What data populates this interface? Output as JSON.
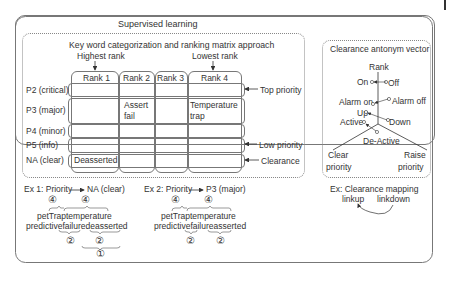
{
  "supervised_learning": {
    "title": "Supervised learning",
    "matrix": {
      "title": "Key word categorization and ranking matrix approach",
      "highest_rank_label": "Highest rank",
      "lowest_rank_label": "Lowest rank",
      "columns": [
        "Rank 1",
        "Rank 2",
        "Rank 3",
        "Rank 4"
      ],
      "rows": [
        {
          "label": "P2 (critical)",
          "cells": [
            "",
            "",
            "",
            ""
          ],
          "side_label": "Top priority"
        },
        {
          "label": "P3 (major)",
          "cells": [
            "",
            "Assert fail",
            "",
            "Temperature trap"
          ],
          "side_label": ""
        },
        {
          "label": "P4 (minor)",
          "cells": [
            "",
            "",
            "",
            ""
          ],
          "side_label": ""
        },
        {
          "label": "P5 (info)",
          "cells": [
            "",
            "",
            "",
            ""
          ],
          "side_label": "Low priority"
        },
        {
          "label": "NA (clear)",
          "cells": [
            "Deasserted",
            "",
            "",
            ""
          ],
          "side_label": "Clearance"
        }
      ],
      "cell_texts": {
        "assert": "Assert",
        "fail": "fail",
        "temperature": "Temperature",
        "trap": "trap",
        "deasserted": "Deasserted"
      }
    },
    "examples": [
      {
        "label": "Ex 1: Priority",
        "target": "NA (clear)",
        "badges_top": [
          "④",
          "④"
        ],
        "line1": "petTraptemperature",
        "line2": "predictivefailuredeasserted",
        "badges_bottom": [
          "②",
          "②"
        ],
        "badge_final": "①"
      },
      {
        "label": "Ex 2: Priority",
        "target": "P3 (major)",
        "badges_top": [
          "④",
          "④"
        ],
        "line1": "petTraptemperature",
        "line2": "predictivefailureasserted",
        "badges_bottom": [
          "②",
          "②"
        ]
      }
    ]
  },
  "clearance_antonym_vector": {
    "title": "Clearance antonym vector",
    "axis_label": "Rank",
    "pairs": [
      {
        "left": "On",
        "right": "Off"
      },
      {
        "left": "Alarm on",
        "right": "Alarm off"
      },
      {
        "left": "Up",
        "right": "Down"
      },
      {
        "left": "Active",
        "right": "De-Active"
      }
    ],
    "bottom_left": [
      "Clear",
      "priority"
    ],
    "bottom_right": [
      "Raise",
      "priority"
    ],
    "example": {
      "label": "Ex: Clearance mapping",
      "left": "linkup",
      "right": "linkdown"
    }
  }
}
